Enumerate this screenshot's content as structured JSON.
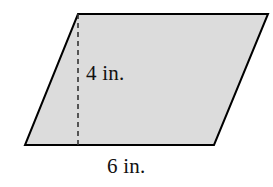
{
  "figure": {
    "name": "parallelogram-with-height",
    "type": "geometry-diagram",
    "shape": "parallelogram",
    "background_color": "#ffffff",
    "fill_color": "#dcdcdc",
    "stroke_color": "#000000",
    "stroke_width": 2,
    "vertices": {
      "top_left": [
        78,
        14
      ],
      "top_right": [
        268,
        14
      ],
      "bottom_right": [
        214,
        145
      ],
      "bottom_left": [
        25,
        145
      ]
    },
    "height_line": {
      "name": "height-dashed-line",
      "from": [
        78,
        14
      ],
      "to": [
        78,
        145
      ],
      "style": "dashed",
      "dash_pattern": "5 4",
      "stroke_color": "#333333",
      "stroke_width": 1.6
    },
    "labels": {
      "height": "4 in.",
      "base": "6 in."
    },
    "measurements": {
      "height_value": 4,
      "base_value": 6,
      "units": "in."
    }
  }
}
